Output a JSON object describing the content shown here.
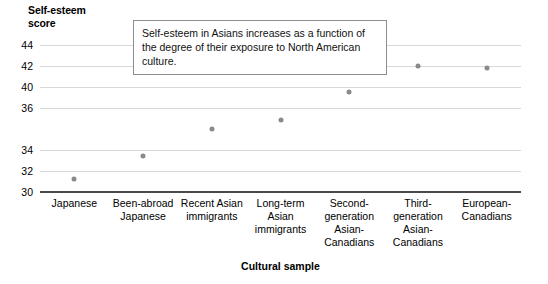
{
  "chart_data": {
    "type": "scatter",
    "title": "",
    "xlabel": "Cultural sample",
    "ylabel": "Self-esteem\nscore",
    "categories": [
      "Japanese",
      "Been-abroad\nJapanese",
      "Recent Asian\nimmigrants",
      "Long-term\nAsian\nimmigrants",
      "Second-\ngeneration\nAsian-\nCanadians",
      "Third-\ngeneration\nAsian-\nCanadians",
      "European-\nCanadians"
    ],
    "values": [
      31.2,
      33.4,
      36.0,
      36.9,
      39.5,
      42.0,
      41.8
    ],
    "ylim": [
      30,
      44
    ],
    "ytick_labels": [
      "44",
      "42",
      "40",
      "36",
      "34",
      "32",
      "30"
    ],
    "ytick_values": [
      44,
      42,
      40,
      38,
      34,
      32,
      30
    ],
    "grid": true,
    "legend": false,
    "annotations": [
      "Self-esteem in Asians increases as a function of the degree of their exposure to North American culture."
    ],
    "marker_color": "#8a8a8a",
    "gridline_color": "#d8d8d8",
    "axis_color": "#4a4a4a"
  }
}
